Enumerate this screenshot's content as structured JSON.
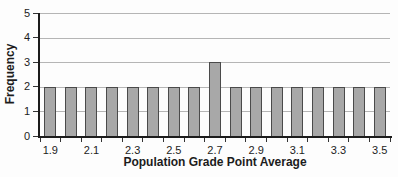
{
  "chart_data": {
    "type": "bar",
    "title": "",
    "xlabel": "Population Grade Point Average",
    "ylabel": "Frequency",
    "categories": [
      "1.9",
      "2.0",
      "2.1",
      "2.2",
      "2.3",
      "2.4",
      "2.5",
      "2.6",
      "2.7",
      "2.8",
      "2.9",
      "3.0",
      "3.1",
      "3.2",
      "3.3",
      "3.4",
      "3.5"
    ],
    "values": [
      2,
      2,
      2,
      2,
      2,
      2,
      2,
      2,
      3,
      2,
      2,
      2,
      2,
      2,
      2,
      2,
      2
    ],
    "x_tick_labels_shown": [
      "1.9",
      "2.1",
      "2.3",
      "2.5",
      "2.7",
      "2.9",
      "3.1",
      "3.3",
      "3.5"
    ],
    "y_ticks": [
      0,
      1,
      2,
      3,
      4,
      5
    ],
    "ylim": [
      0,
      5
    ],
    "grid": "horizontal",
    "legend": "none",
    "colors": {
      "bar_fill": "#a8a8a8",
      "bar_border": "#4a4a4a",
      "gridline": "#b5b5b5",
      "axis": "#1c1c1c",
      "tick": "#333333",
      "text": "#1c1c1c"
    }
  }
}
